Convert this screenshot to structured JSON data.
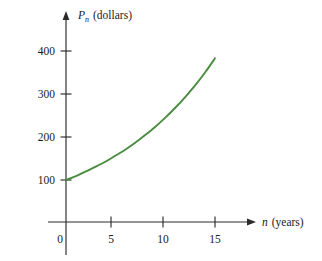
{
  "figure": {
    "background_color": "#ffffff",
    "axis_color": "#2b2b2b",
    "curve_color": "#4a8c3f",
    "y_axis_label_main": "P",
    "y_axis_label_sub": "n",
    "y_axis_label_unit": "(dollars)",
    "x_axis_label_main": "n",
    "x_axis_label_unit": "(years)",
    "origin_label": "0",
    "y_tick_labels": [
      "400",
      "300",
      "200",
      "100"
    ],
    "x_tick_labels": [
      "5",
      "10",
      "15"
    ]
  },
  "chart_data": {
    "type": "line",
    "title": "",
    "subtitle": "",
    "xlabel": "n (years)",
    "ylabel": "P_n (dollars)",
    "xlim": [
      0,
      17.5
    ],
    "ylim": [
      0,
      430
    ],
    "xticks": [
      0,
      5,
      10,
      15
    ],
    "xticklabels": [
      "0",
      "5",
      "10",
      "15"
    ],
    "yticks": [
      100,
      200,
      300,
      400
    ],
    "yticklabels": [
      "100",
      "200",
      "300",
      "400"
    ],
    "grid": false,
    "legend": false,
    "legend_position": "none",
    "annotations": [],
    "series": [
      {
        "name": "P_n = 100(1.094)^n",
        "color": "#4a8c3f",
        "x": [
          0,
          1,
          2,
          3,
          4,
          5,
          6,
          7,
          8,
          9,
          10,
          11,
          12,
          13,
          14,
          15
        ],
        "y": [
          100,
          109,
          120,
          131,
          143,
          157,
          171,
          187,
          205,
          224,
          245,
          268,
          293,
          320,
          350,
          383
        ]
      }
    ]
  }
}
